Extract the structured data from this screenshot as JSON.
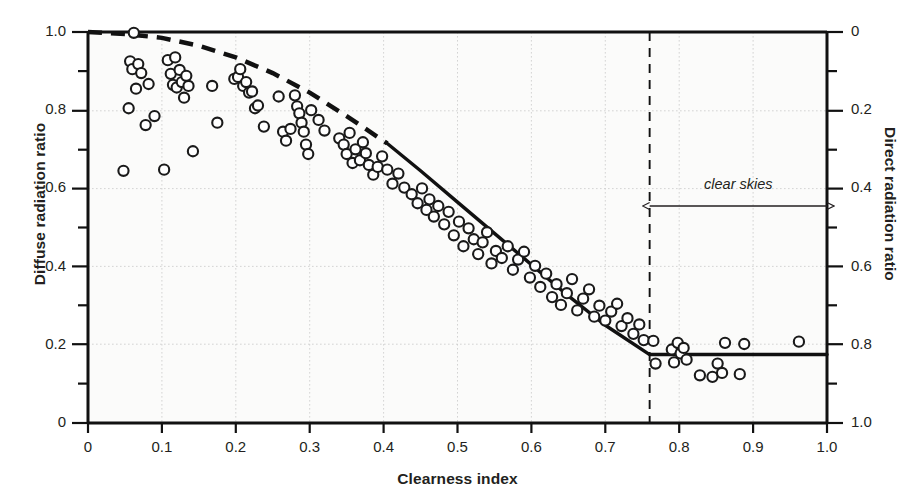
{
  "chart_data": {
    "type": "scatter",
    "title": "",
    "xlabel": "Clearness index",
    "ylabel": "Diffuse radiation ratio",
    "ylabel_right": "Direct radiation ratio",
    "xlim": [
      0,
      1.0
    ],
    "ylim": [
      0,
      1.0
    ],
    "ylim_right": [
      0,
      1.0
    ],
    "y_right_inverted": true,
    "grid": true,
    "legend": "none",
    "xticks": [
      0,
      0.1,
      0.2,
      0.3,
      0.4,
      0.5,
      0.6,
      0.7,
      0.8,
      0.9,
      1.0
    ],
    "xticklabels": [
      "0",
      "0.1",
      "0.2",
      "0.3",
      "0.4",
      "0.5",
      "0.6",
      "0.7",
      "0.8",
      "0.9",
      "1.0"
    ],
    "yticks": [
      0,
      0.2,
      0.4,
      0.6,
      0.8,
      1.0
    ],
    "yticklabels": [
      "0",
      "0.2",
      "0.4",
      "0.6",
      "0.8",
      "1.0"
    ],
    "yticks_right": [
      0,
      0.2,
      0.4,
      0.6,
      0.8,
      1.0
    ],
    "yticklabels_right": [
      "0",
      "0.2",
      "0.4",
      "0.6",
      "0.8",
      "1.0"
    ],
    "minor_tick_step": 0.1,
    "annotations": [
      {
        "text": "clear skies",
        "x_start": 0.76,
        "x_end": 1.0,
        "y": 0.555,
        "style": "double-headed-arrow",
        "italic": true
      }
    ],
    "reference_lines": [
      {
        "name": "clear-sky-threshold",
        "orientation": "vertical",
        "x": 0.76,
        "style": "dashed"
      }
    ],
    "series": [
      {
        "name": "observations",
        "type": "scatter",
        "marker": "open-circle",
        "color": "#1a1a1a",
        "points": [
          [
            0.048,
            0.645
          ],
          [
            0.055,
            0.805
          ],
          [
            0.057,
            0.925
          ],
          [
            0.06,
            0.905
          ],
          [
            0.062,
            0.998
          ],
          [
            0.065,
            0.855
          ],
          [
            0.068,
            0.918
          ],
          [
            0.072,
            0.895
          ],
          [
            0.078,
            0.762
          ],
          [
            0.082,
            0.867
          ],
          [
            0.09,
            0.785
          ],
          [
            0.103,
            0.648
          ],
          [
            0.108,
            0.928
          ],
          [
            0.112,
            0.893
          ],
          [
            0.115,
            0.865
          ],
          [
            0.118,
            0.935
          ],
          [
            0.12,
            0.858
          ],
          [
            0.124,
            0.903
          ],
          [
            0.127,
            0.872
          ],
          [
            0.13,
            0.832
          ],
          [
            0.133,
            0.888
          ],
          [
            0.136,
            0.862
          ],
          [
            0.142,
            0.695
          ],
          [
            0.168,
            0.862
          ],
          [
            0.175,
            0.768
          ],
          [
            0.198,
            0.88
          ],
          [
            0.203,
            0.885
          ],
          [
            0.206,
            0.905
          ],
          [
            0.21,
            0.862
          ],
          [
            0.214,
            0.872
          ],
          [
            0.218,
            0.845
          ],
          [
            0.222,
            0.848
          ],
          [
            0.226,
            0.805
          ],
          [
            0.23,
            0.812
          ],
          [
            0.238,
            0.758
          ],
          [
            0.258,
            0.835
          ],
          [
            0.264,
            0.745
          ],
          [
            0.268,
            0.722
          ],
          [
            0.274,
            0.752
          ],
          [
            0.28,
            0.838
          ],
          [
            0.283,
            0.81
          ],
          [
            0.286,
            0.792
          ],
          [
            0.289,
            0.768
          ],
          [
            0.292,
            0.745
          ],
          [
            0.295,
            0.712
          ],
          [
            0.298,
            0.688
          ],
          [
            0.302,
            0.8
          ],
          [
            0.312,
            0.775
          ],
          [
            0.32,
            0.748
          ],
          [
            0.34,
            0.728
          ],
          [
            0.346,
            0.712
          ],
          [
            0.35,
            0.688
          ],
          [
            0.354,
            0.742
          ],
          [
            0.358,
            0.665
          ],
          [
            0.362,
            0.7
          ],
          [
            0.368,
            0.672
          ],
          [
            0.372,
            0.718
          ],
          [
            0.376,
            0.69
          ],
          [
            0.38,
            0.66
          ],
          [
            0.386,
            0.635
          ],
          [
            0.392,
            0.655
          ],
          [
            0.398,
            0.682
          ],
          [
            0.405,
            0.648
          ],
          [
            0.412,
            0.612
          ],
          [
            0.42,
            0.638
          ],
          [
            0.428,
            0.602
          ],
          [
            0.438,
            0.585
          ],
          [
            0.446,
            0.562
          ],
          [
            0.452,
            0.6
          ],
          [
            0.458,
            0.545
          ],
          [
            0.462,
            0.572
          ],
          [
            0.468,
            0.528
          ],
          [
            0.474,
            0.555
          ],
          [
            0.482,
            0.508
          ],
          [
            0.488,
            0.54
          ],
          [
            0.495,
            0.48
          ],
          [
            0.502,
            0.515
          ],
          [
            0.508,
            0.452
          ],
          [
            0.515,
            0.498
          ],
          [
            0.522,
            0.47
          ],
          [
            0.528,
            0.432
          ],
          [
            0.534,
            0.462
          ],
          [
            0.54,
            0.488
          ],
          [
            0.546,
            0.408
          ],
          [
            0.552,
            0.44
          ],
          [
            0.56,
            0.422
          ],
          [
            0.568,
            0.452
          ],
          [
            0.575,
            0.392
          ],
          [
            0.582,
            0.418
          ],
          [
            0.59,
            0.438
          ],
          [
            0.598,
            0.372
          ],
          [
            0.605,
            0.402
          ],
          [
            0.612,
            0.348
          ],
          [
            0.62,
            0.382
          ],
          [
            0.628,
            0.322
          ],
          [
            0.634,
            0.355
          ],
          [
            0.64,
            0.302
          ],
          [
            0.648,
            0.332
          ],
          [
            0.655,
            0.368
          ],
          [
            0.662,
            0.288
          ],
          [
            0.67,
            0.318
          ],
          [
            0.678,
            0.342
          ],
          [
            0.685,
            0.272
          ],
          [
            0.692,
            0.3
          ],
          [
            0.7,
            0.262
          ],
          [
            0.708,
            0.285
          ],
          [
            0.716,
            0.305
          ],
          [
            0.722,
            0.248
          ],
          [
            0.73,
            0.268
          ],
          [
            0.738,
            0.228
          ],
          [
            0.746,
            0.252
          ],
          [
            0.752,
            0.212
          ],
          [
            0.765,
            0.21
          ],
          [
            0.768,
            0.152
          ],
          [
            0.79,
            0.188
          ],
          [
            0.793,
            0.155
          ],
          [
            0.798,
            0.205
          ],
          [
            0.802,
            0.178
          ],
          [
            0.806,
            0.192
          ],
          [
            0.81,
            0.162
          ],
          [
            0.828,
            0.122
          ],
          [
            0.845,
            0.118
          ],
          [
            0.852,
            0.152
          ],
          [
            0.858,
            0.128
          ],
          [
            0.862,
            0.205
          ],
          [
            0.882,
            0.125
          ],
          [
            0.888,
            0.202
          ],
          [
            0.962,
            0.208
          ]
        ]
      },
      {
        "name": "fitted-curve-extrapolated",
        "type": "line",
        "style": "dashed",
        "color": "#111111",
        "points": [
          [
            0.0,
            1.0
          ],
          [
            0.05,
            0.995
          ],
          [
            0.1,
            0.985
          ],
          [
            0.15,
            0.965
          ],
          [
            0.2,
            0.935
          ],
          [
            0.25,
            0.895
          ],
          [
            0.3,
            0.845
          ],
          [
            0.35,
            0.785
          ],
          [
            0.405,
            0.715
          ]
        ]
      },
      {
        "name": "fitted-curve-measured",
        "type": "line",
        "style": "solid",
        "color": "#111111",
        "points": [
          [
            0.405,
            0.715
          ],
          [
            0.45,
            0.645
          ],
          [
            0.5,
            0.565
          ],
          [
            0.55,
            0.485
          ],
          [
            0.6,
            0.405
          ],
          [
            0.65,
            0.325
          ],
          [
            0.7,
            0.25
          ],
          [
            0.76,
            0.175
          ],
          [
            1.0,
            0.175
          ]
        ]
      }
    ]
  },
  "axes": {
    "x_title": "Clearness index",
    "y_left_title": "Diffuse radiation ratio",
    "y_right_title": "Direct radiation ratio"
  },
  "annotation": {
    "clear_skies_label": "clear skies"
  }
}
